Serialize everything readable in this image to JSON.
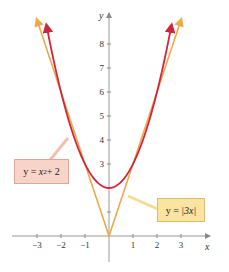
{
  "chart_data": {
    "type": "line",
    "title": "",
    "xlabel": "x",
    "ylabel": "y",
    "xlim": [
      -3.5,
      4
    ],
    "ylim": [
      -1.5,
      9.5
    ],
    "grid": false,
    "x_ticks": [
      -3,
      -2,
      -1,
      1,
      2,
      3
    ],
    "x_tick_labels": [
      "−3",
      "−2",
      "−1",
      "1",
      "2",
      "3"
    ],
    "y_ticks": [
      1,
      3,
      4,
      5,
      6,
      7,
      8
    ],
    "y_tick_labels": [
      "",
      "3",
      "4",
      "5",
      "6",
      "7",
      "8"
    ],
    "series": [
      {
        "name": "y = x^2 + 2",
        "label": "y = x² + 2",
        "color": "#d0263c",
        "x": [
          -2.646,
          -2,
          -1,
          0,
          1,
          2,
          2.646
        ],
        "values": [
          9,
          6,
          3,
          2,
          3,
          6,
          9
        ]
      },
      {
        "name": "y = |3x|",
        "label": "y = |3x|",
        "color": "#f0a848",
        "x": [
          -3,
          -2,
          -1,
          0,
          1,
          2,
          3
        ],
        "values": [
          9,
          6,
          3,
          0,
          3,
          6,
          9
        ]
      }
    ],
    "annotations": [
      {
        "text": "y = x² + 2",
        "box_color": "#f8d3c8",
        "position": "left"
      },
      {
        "text": "y = |3x|",
        "box_color": "#fbe3a0",
        "position": "right"
      }
    ]
  },
  "labels": {
    "parabola": {
      "lhs": "y = ",
      "var": "x",
      "exp": "2",
      "rhs": " + 2"
    },
    "absval": {
      "lhs": "y = ",
      "inner": "|3x|"
    }
  }
}
